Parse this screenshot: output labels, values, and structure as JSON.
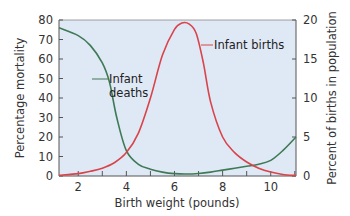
{
  "chart_data": {
    "type": "line",
    "title": "",
    "xlabel": "Birth weight (pounds)",
    "ylabel": "Percentage mortality",
    "ylabel_right": "Percent of births in population",
    "xlim": [
      1.2,
      11.05
    ],
    "ylim": [
      0,
      80
    ],
    "ylim_right": [
      0,
      20
    ],
    "x_ticks": [
      "2",
      "4",
      "6",
      "8",
      "10"
    ],
    "y_ticks": [
      "0",
      "10",
      "20",
      "30",
      "40",
      "50",
      "60",
      "70",
      "80"
    ],
    "y_ticks_right": [
      "0",
      "5",
      "10",
      "15",
      "20"
    ],
    "grid": false,
    "legend": "none (inline annotations)",
    "background": "#dfe8f5",
    "series": [
      {
        "name": "Infant deaths",
        "axis": "left",
        "color": "#3e7a55",
        "x": [
          1.2,
          2,
          2.5,
          3,
          3.3,
          3.6,
          4,
          4.5,
          5,
          5.5,
          6,
          6.5,
          7,
          7.5,
          8,
          8.5,
          9,
          9.5,
          10,
          10.5,
          11.05
        ],
        "values": [
          76,
          72,
          67,
          58,
          48,
          30,
          13,
          6,
          3.5,
          2,
          1.2,
          1,
          1.3,
          2,
          3,
          4,
          5,
          6,
          8,
          13,
          20
        ]
      },
      {
        "name": "Infant births",
        "axis": "right",
        "color": "#d9444a",
        "x": [
          1.2,
          2,
          2.5,
          3,
          3.5,
          4,
          4.5,
          5,
          5.5,
          6,
          6.3,
          6.6,
          6.9,
          7.2,
          7.5,
          8,
          8.5,
          9,
          9.5,
          10,
          10.5,
          11.05
        ],
        "values": [
          0.1,
          0.3,
          0.6,
          1.0,
          1.7,
          3.0,
          5.5,
          10,
          15.5,
          18.8,
          19.6,
          19.5,
          18.3,
          14.5,
          9.5,
          5.0,
          3.0,
          1.8,
          1.0,
          0.5,
          0.2,
          0.05
        ]
      }
    ],
    "annotations": [
      {
        "text_lines": [
          "Infant",
          "deaths"
        ],
        "points_to": "Infant deaths"
      },
      {
        "text_lines": [
          "Infant births"
        ],
        "points_to": "Infant births"
      }
    ]
  },
  "labels": {
    "xlabel": "Birth weight (pounds)",
    "ylabel_left": "Percentage mortality",
    "ylabel_right": "Percent of births in population",
    "ann_deaths_1": "Infant",
    "ann_deaths_2": "deaths",
    "ann_births": "Infant births"
  }
}
